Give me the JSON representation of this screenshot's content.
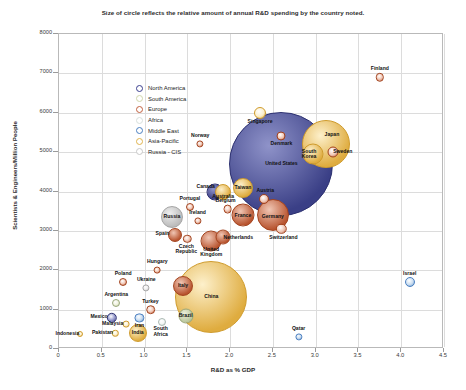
{
  "chart_data": {
    "type": "scatter",
    "title": "Size of circle reflects the relative amount of annual R&D spending by the country noted.",
    "xlabel": "R&D as % GDP",
    "ylabel": "Scientists & Engineers/Million People",
    "xlim": [
      0,
      4.5
    ],
    "ylim": [
      0,
      8000
    ],
    "xticks": [
      "0",
      "0.5",
      "1.0",
      "1.5",
      "2.0",
      "2.5",
      "3.0",
      "3.5",
      "4.0",
      "4.5"
    ],
    "yticks": [
      "0",
      "1000",
      "2000",
      "3000",
      "4000",
      "5000",
      "6000",
      "7000",
      "8000"
    ],
    "grid": true,
    "size_encodes": "relative amount of annual R&D spending",
    "legend": {
      "position": "top-left inside plot",
      "entries": [
        {
          "label": "North America",
          "color": "#3b3f8f"
        },
        {
          "label": "South America",
          "color": "#cfd6ac"
        },
        {
          "label": "Europe",
          "color": "#c2603f"
        },
        {
          "label": "Africa",
          "color": "#d7e0dc"
        },
        {
          "label": "Middle East",
          "color": "#4a7fc1"
        },
        {
          "label": "Asia-Pacific",
          "color": "#e0b44e"
        },
        {
          "label": "Russia - CIS",
          "color": "#c8c8c8"
        }
      ]
    },
    "points": [
      {
        "name": "Finland",
        "x": 3.75,
        "y": 6900,
        "r": 4.2,
        "region": "Europe",
        "label_dx": 0,
        "label_dy": -8
      },
      {
        "name": "Singapore",
        "x": 2.35,
        "y": 6000,
        "r": 6.0,
        "region": "Asia-Pacific",
        "label_dx": 0,
        "label_dy": 9
      },
      {
        "name": "Denmark",
        "x": 2.6,
        "y": 5400,
        "r": 4.5,
        "region": "Europe",
        "label_dx": 0,
        "label_dy": 8
      },
      {
        "name": "Japan",
        "x": 3.12,
        "y": 5200,
        "r": 24.0,
        "region": "Asia-Pacific",
        "label_dx": 6,
        "label_dy": -9
      },
      {
        "name": "Sweden",
        "x": 3.2,
        "y": 5000,
        "r": 5.5,
        "region": "Europe",
        "label_dx": 10,
        "label_dy": 0
      },
      {
        "name": "South Korea",
        "x": 2.97,
        "y": 4950,
        "r": 10.5,
        "region": "Asia-Pacific",
        "label_dx": -4,
        "label_dy": 0
      },
      {
        "name": "United States",
        "x": 2.6,
        "y": 4700,
        "r": 52.0,
        "region": "North America",
        "label_dx": 0,
        "label_dy": 0
      },
      {
        "name": "Norway",
        "x": 1.65,
        "y": 5200,
        "r": 3.6,
        "region": "Europe",
        "label_dx": 0,
        "label_dy": -8
      },
      {
        "name": "Taiwan",
        "x": 2.15,
        "y": 4100,
        "r": 10.0,
        "region": "Asia-Pacific",
        "label_dx": 0,
        "label_dy": 0
      },
      {
        "name": "Australia",
        "x": 1.92,
        "y": 4000,
        "r": 8.0,
        "region": "Asia-Pacific",
        "label_dx": 0,
        "label_dy": 5
      },
      {
        "name": "Canada",
        "x": 1.82,
        "y": 4000,
        "r": 8.5,
        "region": "North America",
        "label_dx": -9,
        "label_dy": -5
      },
      {
        "name": "Austria",
        "x": 2.4,
        "y": 3800,
        "r": 5.0,
        "region": "Europe",
        "label_dx": 1,
        "label_dy": -8
      },
      {
        "name": "Germany",
        "x": 2.5,
        "y": 3400,
        "r": 16.0,
        "region": "Europe",
        "label_dx": 0,
        "label_dy": 2
      },
      {
        "name": "Belgium",
        "x": 1.97,
        "y": 3550,
        "r": 4.4,
        "region": "Europe",
        "label_dx": -2,
        "label_dy": -8
      },
      {
        "name": "France",
        "x": 2.15,
        "y": 3400,
        "r": 11.5,
        "region": "Europe",
        "label_dx": 0,
        "label_dy": 1
      },
      {
        "name": "Switzerland",
        "x": 2.6,
        "y": 3050,
        "r": 5.2,
        "region": "Europe",
        "label_dx": 2,
        "label_dy": 9
      },
      {
        "name": "Portugal",
        "x": 1.53,
        "y": 3600,
        "r": 4.0,
        "region": "Europe",
        "label_dx": 0,
        "label_dy": -8
      },
      {
        "name": "Russia",
        "x": 1.32,
        "y": 3350,
        "r": 11.0,
        "region": "Russia - CIS",
        "label_dx": 0,
        "label_dy": 0
      },
      {
        "name": "Ireland",
        "x": 1.62,
        "y": 3250,
        "r": 3.6,
        "region": "Europe",
        "label_dx": 0,
        "label_dy": -8
      },
      {
        "name": "Spain",
        "x": 1.35,
        "y": 2900,
        "r": 7.0,
        "region": "Europe",
        "label_dx": -12,
        "label_dy": -1
      },
      {
        "name": "Netherlands",
        "x": 1.92,
        "y": 2850,
        "r": 7.5,
        "region": "Europe",
        "label_dx": 15,
        "label_dy": 1
      },
      {
        "name": "Czech Republic",
        "x": 1.5,
        "y": 2800,
        "r": 4.2,
        "region": "Europe",
        "label_dx": -1,
        "label_dy": 10
      },
      {
        "name": "United Kingdom",
        "x": 1.78,
        "y": 2750,
        "r": 10.5,
        "region": "Europe",
        "label_dx": 0,
        "label_dy": 11
      },
      {
        "name": "Hungary",
        "x": 1.15,
        "y": 2000,
        "r": 3.4,
        "region": "Europe",
        "label_dx": 0,
        "label_dy": -8
      },
      {
        "name": "Poland",
        "x": 0.75,
        "y": 1700,
        "r": 4.0,
        "region": "Europe",
        "label_dx": 0,
        "label_dy": -8
      },
      {
        "name": "Ukraine",
        "x": 1.02,
        "y": 1550,
        "r": 3.6,
        "region": "Russia - CIS",
        "label_dx": 0,
        "label_dy": -8
      },
      {
        "name": "Italy",
        "x": 1.45,
        "y": 1600,
        "r": 10.0,
        "region": "Europe",
        "label_dx": 0,
        "label_dy": 0
      },
      {
        "name": "China",
        "x": 1.78,
        "y": 1320,
        "r": 36.0,
        "region": "Asia-Pacific",
        "label_dx": 0,
        "label_dy": 0
      },
      {
        "name": "Argentina",
        "x": 0.67,
        "y": 1180,
        "r": 4.0,
        "region": "South America",
        "label_dx": 0,
        "label_dy": -8
      },
      {
        "name": "Turkey",
        "x": 1.07,
        "y": 1000,
        "r": 4.8,
        "region": "Europe",
        "label_dx": 0,
        "label_dy": -8
      },
      {
        "name": "Mexico",
        "x": 0.62,
        "y": 800,
        "r": 5.2,
        "region": "North America",
        "label_dx": -13,
        "label_dy": -1
      },
      {
        "name": "Iran",
        "x": 0.94,
        "y": 790,
        "r": 4.6,
        "region": "Middle East",
        "label_dx": 0,
        "label_dy": 8
      },
      {
        "name": "Malaysia",
        "x": 0.78,
        "y": 640,
        "r": 3.4,
        "region": "Asia-Pacific",
        "label_dx": -13,
        "label_dy": 0
      },
      {
        "name": "Brazil",
        "x": 1.48,
        "y": 830,
        "r": 7.5,
        "region": "South America",
        "label_dx": 0,
        "label_dy": 0
      },
      {
        "name": "South Africa",
        "x": 1.2,
        "y": 680,
        "r": 4.0,
        "region": "Africa",
        "label_dx": -1,
        "label_dy": 9
      },
      {
        "name": "India",
        "x": 0.92,
        "y": 400,
        "r": 9.0,
        "region": "Asia-Pacific",
        "label_dx": 0,
        "label_dy": 0
      },
      {
        "name": "Pakistan",
        "x": 0.66,
        "y": 400,
        "r": 3.2,
        "region": "Asia-Pacific",
        "label_dx": -13,
        "label_dy": 0
      },
      {
        "name": "Indonesia",
        "x": 0.25,
        "y": 380,
        "r": 3.0,
        "region": "Asia-Pacific",
        "label_dx": -13,
        "label_dy": 0
      },
      {
        "name": "Qatar",
        "x": 2.8,
        "y": 300,
        "r": 3.6,
        "region": "Middle East",
        "label_dx": 0,
        "label_dy": -8
      },
      {
        "name": "Israel",
        "x": 4.1,
        "y": 1700,
        "r": 5.0,
        "region": "Middle East",
        "label_dx": 0,
        "label_dy": -8
      }
    ]
  }
}
